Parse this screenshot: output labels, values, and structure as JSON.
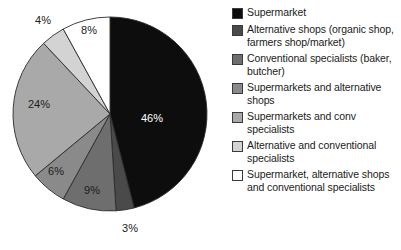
{
  "chart_data": {
    "type": "pie",
    "title": "",
    "subtitle": "",
    "xlabel": "",
    "ylabel": "",
    "legend_position": "right",
    "grid": false,
    "start_angle_deg": 0,
    "direction": "clockwise",
    "categories": [
      "Supermarket",
      "Alternative shops (organic shop, farmers shop/market)",
      "Conventional specialists (baker, butcher)",
      "Supermarkets and alternative shops",
      "Supermarkets and conv specialists",
      "Alternative and conventional specialists",
      "Supermarket, alternative shops and conventional specialists"
    ],
    "values": [
      46,
      3,
      9,
      6,
      24,
      4,
      8
    ],
    "value_labels": [
      "46%",
      "3%",
      "9%",
      "6%",
      "24%",
      "4%",
      "8%"
    ],
    "colors": [
      "#0d0d0d",
      "#4a4a4a",
      "#6e6e6e",
      "#8a8a8a",
      "#a9a9a9",
      "#d3d3d3",
      "#ffffff"
    ],
    "label_colors": [
      "#ffffff",
      "#1b1b1b",
      "#1b1b1b",
      "#1b1b1b",
      "#1b1b1b",
      "#1b1b1b",
      "#1b1b1b"
    ],
    "label_outside": [
      false,
      true,
      false,
      false,
      false,
      true,
      false
    ]
  },
  "pie": {
    "center_x": 110,
    "center_y": 114,
    "radius": 97,
    "slices": [
      {
        "name": "supermarket",
        "label": "46%",
        "value": 46,
        "color": "#0d0d0d",
        "label_color": "#ffffff",
        "label_x": 152,
        "label_y": 122
      },
      {
        "name": "alternative-shops",
        "label": "3%",
        "value": 3,
        "color": "#4a4a4a",
        "label_color": "#1b1b1b",
        "label_x": 130,
        "label_y": 232
      },
      {
        "name": "conventional-specialists",
        "label": "9%",
        "value": 9,
        "color": "#6e6e6e",
        "label_color": "#1b1b1b",
        "label_x": 92,
        "label_y": 194
      },
      {
        "name": "supermarkets-and-alternative-shops",
        "label": "6%",
        "value": 6,
        "color": "#8a8a8a",
        "label_color": "#1b1b1b",
        "label_x": 56,
        "label_y": 175
      },
      {
        "name": "supermarkets-and-conv-specialists",
        "label": "24%",
        "value": 24,
        "color": "#a9a9a9",
        "label_color": "#1b1b1b",
        "label_x": 39,
        "label_y": 108
      },
      {
        "name": "alternative-and-conventional-specialists",
        "label": "4%",
        "value": 4,
        "color": "#d3d3d3",
        "label_color": "#1b1b1b",
        "label_x": 43,
        "label_y": 24
      },
      {
        "name": "supermarket-alternative-conventional",
        "label": "8%",
        "value": 8,
        "color": "#ffffff",
        "label_color": "#1b1b1b",
        "label_x": 89,
        "label_y": 34
      }
    ]
  },
  "legend": {
    "items": [
      {
        "label": "Supermarket",
        "color": "#0d0d0d",
        "swatch_name": "legend-swatch-supermarket"
      },
      {
        "label": "Alternative shops (organic shop, farmers shop/market)",
        "color": "#4a4a4a",
        "swatch_name": "legend-swatch-alternative-shops"
      },
      {
        "label": "Conventional specialists (baker, butcher)",
        "color": "#6e6e6e",
        "swatch_name": "legend-swatch-conventional-specialists"
      },
      {
        "label": "Supermarkets and alternative shops",
        "color": "#8a8a8a",
        "swatch_name": "legend-swatch-supermarkets-and-alternative-shops"
      },
      {
        "label": "Supermarkets and conv specialists",
        "color": "#a9a9a9",
        "swatch_name": "legend-swatch-supermarkets-and-conv-specialists"
      },
      {
        "label": "Alternative and conventional specialists",
        "color": "#d3d3d3",
        "swatch_name": "legend-swatch-alternative-and-conventional-specialists"
      },
      {
        "label": "Supermarket, alternative shops and conventional specialists",
        "color": "#ffffff",
        "swatch_name": "legend-swatch-supermarket-alternative-conventional"
      }
    ]
  }
}
